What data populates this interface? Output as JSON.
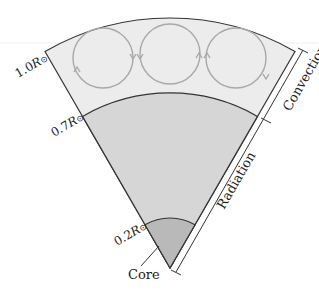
{
  "diagram": {
    "zones": [
      {
        "name": "convection",
        "label": "Convection",
        "inner_radius": 0.7,
        "outer_radius": 1.0,
        "color": "#ececec"
      },
      {
        "name": "radiation",
        "label": "Radiation",
        "inner_radius": 0.2,
        "outer_radius": 0.7,
        "color": "#d6d6d6"
      },
      {
        "name": "core",
        "label": "Core",
        "inner_radius": 0.0,
        "outer_radius": 0.2,
        "color": "#b9b9b9"
      }
    ],
    "radius_labels": {
      "r10": {
        "num": "1.0",
        "sym": "R",
        "sub": "⊙"
      },
      "r07": {
        "num": "0.7",
        "sym": "R",
        "sub": "⊙"
      },
      "r02": {
        "num": "0.2",
        "sym": "R",
        "sub": "⊙"
      }
    },
    "side_labels": {
      "convection": "Convection",
      "radiation": "Radiation"
    },
    "core_label": "Core",
    "convection_cells": 3,
    "colors": {
      "outline": "#333333",
      "cell_stroke": "#a8a8a8",
      "convection_fill": "#ececec",
      "radiation_fill": "#d6d6d6",
      "core_fill": "#b9b9b9"
    }
  }
}
